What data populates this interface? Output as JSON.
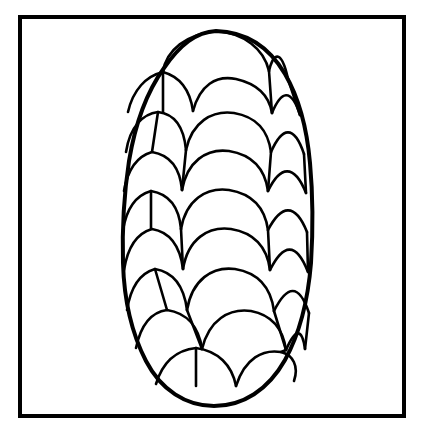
{
  "document": {
    "kind": "coloring-page-line-art",
    "title": "Pine Cone",
    "description": "Black and white outline drawing of a pine cone made of overlapping scalloped scales, enclosed in a rectangular border frame.",
    "background_color": "#ffffff",
    "line_color": "#000000",
    "canvas": {
      "width": 421,
      "height": 433
    }
  },
  "frame": {
    "name": "border-frame",
    "x": 20,
    "y": 17,
    "width": 384,
    "height": 399,
    "stroke_width": 4,
    "stroke_color": "#000000",
    "fill": "none"
  },
  "cone": {
    "name": "pine-cone",
    "outline_stroke_width": 4,
    "scale_stroke_width": 2.6,
    "stroke_color": "#000000",
    "fill": "#ffffff",
    "apex": {
      "x": 216,
      "y": 31
    },
    "base_tip": {
      "x": 214,
      "y": 406
    },
    "widest": {
      "y": 268,
      "left_x": 124,
      "right_x": 312
    },
    "outline_path": "M216,31 C249,32 271,50 285,74 C299,98 307,129 310,163 C313,196 313,231 311,263 C308,300 300,333 285,360 C268,390 243,406 214,406 C186,406 161,390 146,361 C131,332 124,298 123,263 C122,228 124,194 129,161 C135,125 146,93 164,68 C180,45 196,32 216,31 Z",
    "rows": [
      {
        "index": 0,
        "label": "row-apex",
        "scale_count": 2,
        "baseline_y": 70
      },
      {
        "index": 1,
        "label": "row-2",
        "scale_count": 3,
        "baseline_y": 108
      },
      {
        "index": 2,
        "label": "row-3",
        "scale_count": 3,
        "baseline_y": 146
      },
      {
        "index": 3,
        "label": "row-4",
        "scale_count": 4,
        "baseline_y": 184
      },
      {
        "index": 4,
        "label": "row-5",
        "scale_count": 4,
        "baseline_y": 222
      },
      {
        "index": 5,
        "label": "row-6",
        "scale_count": 4,
        "baseline_y": 262
      },
      {
        "index": 6,
        "label": "row-7",
        "scale_count": 4,
        "baseline_y": 302
      },
      {
        "index": 7,
        "label": "row-8",
        "scale_count": 3,
        "baseline_y": 342
      },
      {
        "index": 8,
        "label": "row-base",
        "scale_count": 2,
        "baseline_y": 382
      }
    ],
    "scale_paths": [
      "M163,72 C166,50 187,34 216,31 C244,33 264,49 269,71",
      "M269,71 C273,54 281,47 288,79",
      "M128,112 C133,90 146,76 163,72 C181,77 190,90 193,111",
      "M193,111 C200,85 216,75 236,79 C258,84 269,95 272,113",
      "M272,113 C281,91 291,87 300,115",
      "M126,152 C130,126 143,114 158,112 C175,114 184,128 186,150",
      "M186,150 C192,122 212,110 234,113 C257,117 268,130 271,152",
      "M271,152 C282,127 294,124 304,154",
      "M124,191 C128,168 138,156 152,152 C170,155 180,168 182,190",
      "M182,190 C187,162 206,148 229,151 C253,155 265,169 268,191",
      "M268,191 C280,166 294,163 306,193",
      "M123,230 C127,206 137,195 151,191 C169,194 179,207 181,229",
      "M181,229 C186,200 206,187 229,190 C253,194 265,208 268,230",
      "M268,230 C281,205 295,202 307,232",
      "M124,270 C128,245 138,233 152,229 C170,232 180,246 183,269",
      "M183,269 C188,239 208,226 231,229 C255,233 267,247 270,270",
      "M270,270 C283,244 296,241 308,272",
      "M127,310 C131,285 141,273 155,269 C173,272 184,286 187,310",
      "M187,310 C192,280 212,266 235,269 C259,273 271,288 274,311",
      "M274,311 C287,285 299,283 309,313",
      "M136,348 C141,324 152,312 167,310 C187,313 199,327 202,349",
      "M202,349 C209,320 229,308 251,311 C272,315 283,329 286,350",
      "M286,350 C295,329 302,327 305,349",
      "M156,384 C163,361 177,350 196,348 C218,351 232,365 236,386",
      "M236,386 C245,358 263,349 281,352 C293,355 299,366 294,381"
    ],
    "radial_dividers": [
      "M163,72 L163,112",
      "M269,71 L272,113",
      "M288,79 L300,115",
      "M158,112 L152,152",
      "M186,150 L182,190",
      "M271,152 L268,191",
      "M304,154 L306,193",
      "M151,191 L151,229",
      "M181,229 L183,269",
      "M268,230 L270,270",
      "M307,232 L308,272",
      "M155,269 L167,310",
      "M187,310 L202,349",
      "M274,311 L286,350",
      "M309,313 L305,349",
      "M196,348 L196,386",
      "M286,350 L281,352"
    ]
  }
}
